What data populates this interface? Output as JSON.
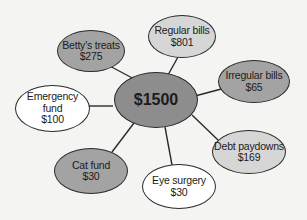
{
  "diagram": {
    "colors": {
      "background": "#f4f4f3",
      "line": "#2a2a2a",
      "dark": "#8d8d8d",
      "medium": "#a3a3a3",
      "light": "#d6d6d6",
      "white": "#ffffff"
    },
    "center": {
      "label": "$1500",
      "shade": "dark"
    },
    "nodes": [
      {
        "id": "regular-bills",
        "label": "Regular bills",
        "amount": "$801",
        "shade": "light"
      },
      {
        "id": "bettys-treats",
        "label": "Betty's treats",
        "amount": "$275",
        "shade": "medium"
      },
      {
        "id": "irregular-bills",
        "label": "Irregular bills",
        "amount": "$65",
        "shade": "medium"
      },
      {
        "id": "emergency-fund",
        "label_line1": "Emergency",
        "label_line2": "fund",
        "amount": "$100",
        "shade": "white"
      },
      {
        "id": "debt-paydowns",
        "label": "Debt paydowns",
        "amount": "$169",
        "shade": "light"
      },
      {
        "id": "cat-fund",
        "label": "Cat fund",
        "amount": "$30",
        "shade": "medium"
      },
      {
        "id": "eye-surgery",
        "label": "Eye surgery",
        "amount": "$30",
        "shade": "white"
      }
    ]
  }
}
